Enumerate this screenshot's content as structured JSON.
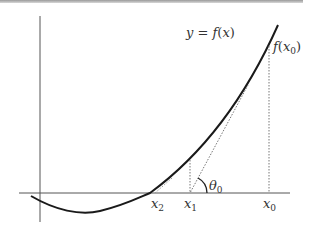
{
  "diagram": {
    "type": "newton-method-illustration",
    "curve_label": "y = f(x)",
    "point_label": "f(x0)",
    "angle_label": "θ0",
    "x_labels": [
      {
        "id": "x2",
        "base": "x",
        "sub": "2"
      },
      {
        "id": "x1",
        "base": "x",
        "sub": "1"
      },
      {
        "id": "x0",
        "base": "x",
        "sub": "0"
      }
    ],
    "label_text": {
      "y": "y",
      "eq": " = ",
      "f": "f",
      "x": "x",
      "theta": "θ",
      "sub0": "0",
      "sub1": "1",
      "sub2": "2",
      "lp": "(",
      "rp": ")"
    },
    "colors": {
      "curve": "#1a1a1a",
      "axes": "#555555",
      "dotted": "#777777",
      "text": "#333333"
    }
  }
}
